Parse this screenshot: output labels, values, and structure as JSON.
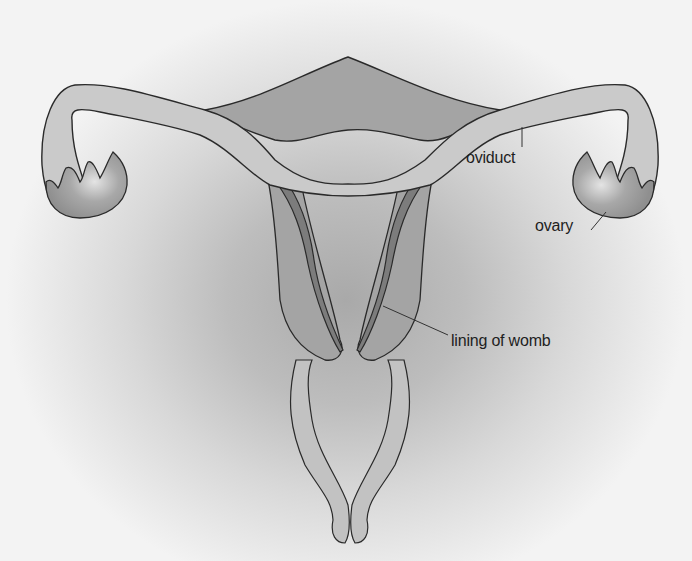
{
  "diagram": {
    "labels": [
      {
        "id": "oviduct",
        "text": "oviduct",
        "x": 470,
        "y": 147
      },
      {
        "id": "ovary",
        "text": "ovary",
        "x": 536,
        "y": 215
      },
      {
        "id": "lining",
        "text": "lining of womb",
        "x": 452,
        "y": 330
      }
    ]
  },
  "colors": {
    "outline": "#2a2a2a",
    "tube_fill": "#c6c6c6",
    "muscle_fill": "#a4a4a4",
    "lining_fill": "#7c7c7c",
    "ovary_fill": "#9a9a9a",
    "cavity_fill": "#d2d2d2",
    "background_center": "#a9a9a9",
    "background_edge": "#f3f3f3"
  }
}
